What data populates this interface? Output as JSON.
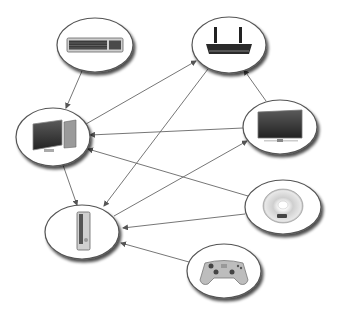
{
  "diagram": {
    "type": "device-connectivity-graph",
    "colors": {
      "edge": "#666666",
      "node_fill": "#ffffff",
      "node_stroke": "#555555",
      "shadow": "#8a8a8a"
    },
    "nodes": [
      {
        "id": "keyboard",
        "icon": "keyboard-icon",
        "cx": 95,
        "cy": 45,
        "rx": 38,
        "ry": 27
      },
      {
        "id": "router",
        "icon": "wireless-router-icon",
        "cx": 229,
        "cy": 45,
        "rx": 37,
        "ry": 28
      },
      {
        "id": "pc",
        "icon": "desktop-computer-icon",
        "cx": 53,
        "cy": 137,
        "rx": 37,
        "ry": 29
      },
      {
        "id": "tv",
        "icon": "flat-screen-tv-icon",
        "cx": 280,
        "cy": 127,
        "rx": 37,
        "ry": 27
      },
      {
        "id": "console",
        "icon": "game-console-icon",
        "cx": 82,
        "cy": 232,
        "rx": 37,
        "ry": 27
      },
      {
        "id": "dvd",
        "icon": "dvd-disc-icon",
        "cx": 283,
        "cy": 207,
        "rx": 38,
        "ry": 27
      },
      {
        "id": "gamepad",
        "icon": "gamepad-icon",
        "cx": 224,
        "cy": 271,
        "rx": 37,
        "ry": 27
      }
    ],
    "edges": [
      {
        "from": "keyboard",
        "to": "pc",
        "x1": 82,
        "y1": 71,
        "x2": 66,
        "y2": 108
      },
      {
        "from": "pc",
        "to": "router",
        "x1": 86,
        "y1": 124,
        "x2": 196,
        "y2": 61
      },
      {
        "from": "router",
        "to": "console",
        "x1": 208,
        "y1": 69,
        "x2": 104,
        "y2": 206
      },
      {
        "from": "tv",
        "to": "router",
        "x1": 266,
        "y1": 101,
        "x2": 244,
        "y2": 70
      },
      {
        "from": "tv",
        "to": "pc",
        "x1": 243,
        "y1": 128,
        "x2": 90,
        "y2": 135
      },
      {
        "from": "dvd",
        "to": "pc",
        "x1": 248,
        "y1": 196,
        "x2": 88,
        "y2": 149
      },
      {
        "from": "pc",
        "to": "console",
        "x1": 63,
        "y1": 165,
        "x2": 77,
        "y2": 205
      },
      {
        "from": "console",
        "to": "tv",
        "x1": 114,
        "y1": 216,
        "x2": 247,
        "y2": 141
      },
      {
        "from": "dvd",
        "to": "console",
        "x1": 245,
        "y1": 214,
        "x2": 123,
        "y2": 228
      },
      {
        "from": "gamepad",
        "to": "console",
        "x1": 189,
        "y1": 262,
        "x2": 121,
        "y2": 243
      }
    ]
  }
}
